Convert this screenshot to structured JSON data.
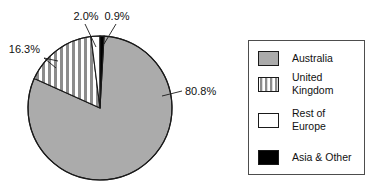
{
  "chart_data": {
    "type": "pie",
    "title": "",
    "subtitle": "",
    "xlabel": "",
    "ylabel": "",
    "categories": [
      "Australia",
      "United Kingdom",
      "Rest of Europe",
      "Asia & Other"
    ],
    "values": [
      80.8,
      16.3,
      2.0,
      0.9
    ],
    "value_labels": [
      "80.8%",
      "16.3%",
      "2.0%",
      "0.9%"
    ],
    "units": "percent",
    "legend_position": "right",
    "grid": false,
    "start_angle_deg": 0,
    "direction": "clockwise",
    "slices": [
      {
        "name": "Australia",
        "value": 80.8,
        "label": "80.8%",
        "fill_style": "solid-gray",
        "color": "#ababab"
      },
      {
        "name": "United Kingdom",
        "value": 16.3,
        "label": "16.3%",
        "fill_style": "vertical-stripes",
        "color": "#8c8c8c"
      },
      {
        "name": "Rest of Europe",
        "value": 2.0,
        "label": "2.0%",
        "fill_style": "solid-white",
        "color": "#ffffff"
      },
      {
        "name": "Asia & Other",
        "value": 0.9,
        "label": "0.9%",
        "fill_style": "solid-black",
        "color": "#000000"
      }
    ]
  },
  "legend": {
    "items": [
      {
        "label": "Australia",
        "label_line1": "Australia",
        "label_line2": "",
        "swatch": "gray-swatch"
      },
      {
        "label": "United Kingdom",
        "label_line1": "United",
        "label_line2": "Kingdom",
        "swatch": "striped-swatch"
      },
      {
        "label": "Rest of Europe",
        "label_line1": "Rest of",
        "label_line2": "Europe",
        "swatch": "white-swatch"
      },
      {
        "label": "Asia & Other",
        "label_line1": "Asia & Other",
        "label_line2": "",
        "swatch": "black-swatch"
      }
    ]
  },
  "colors": {
    "background": "#ffffff",
    "outline": "#1a1a1a",
    "gray_fill": "#ababab",
    "stripe_fill": "#8c8c8c",
    "black_fill": "#000000",
    "white_fill": "#ffffff",
    "legend_border": "#4d4d4d",
    "text": "#111111"
  }
}
